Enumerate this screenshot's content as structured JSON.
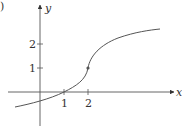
{
  "figure": {
    "corner_mark": ")",
    "axes": {
      "x_label": "x",
      "y_label": "y",
      "x_ticks": [
        "1",
        "2"
      ],
      "y_ticks": [
        "1",
        "2"
      ]
    },
    "curve": {
      "description": "increasing curve with vertical tangent (inflection) at point (2,1)",
      "marked_point": [
        2,
        1
      ],
      "passes_through": [
        [
          1,
          0
        ],
        [
          2,
          1
        ]
      ],
      "color": "#555555"
    }
  }
}
